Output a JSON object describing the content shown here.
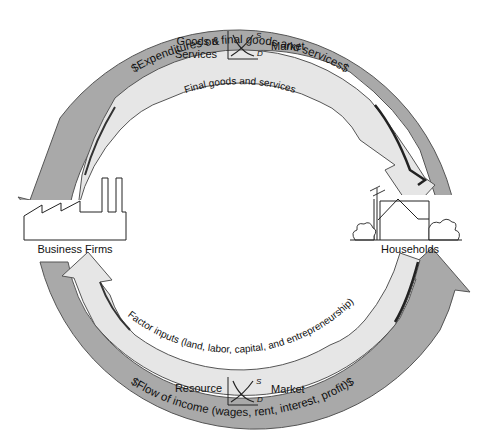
{
  "diagram": {
    "nodes": {
      "firms": {
        "label": "Business Firms",
        "icon": "factory-icon"
      },
      "households": {
        "label": "Households",
        "icon": "house-icon"
      }
    },
    "markets": {
      "goods": {
        "label_line1": "Goods &",
        "label_line2": "Services",
        "market_label": "Market",
        "supply_label": "S",
        "demand_label": "D",
        "icon": "supply-demand-graph-icon"
      },
      "resource": {
        "label": "Resource",
        "market_label": "Market",
        "supply_label": "S",
        "demand_label": "D",
        "icon": "supply-demand-graph-icon"
      }
    },
    "flows": {
      "top_outer": {
        "text": "$Expenditures on final goods and services$",
        "direction": "households-to-firms",
        "kind": "money"
      },
      "top_inner": {
        "text": "Final goods and services",
        "direction": "firms-to-households",
        "kind": "real"
      },
      "bottom_inner": {
        "text": "Factor inputs (land, labor, capital, and entrepreneurship)",
        "direction": "households-to-firms",
        "kind": "real"
      },
      "bottom_outer": {
        "text": "$Flow of income (wages, rent, interest, profit)$",
        "direction": "firms-to-households",
        "kind": "money"
      }
    },
    "colors": {
      "money_band": "#a9a9a9",
      "real_band": "#e6e6e6",
      "outline": "#3a3a3a",
      "text": "#111111",
      "background": "#ffffff"
    }
  }
}
